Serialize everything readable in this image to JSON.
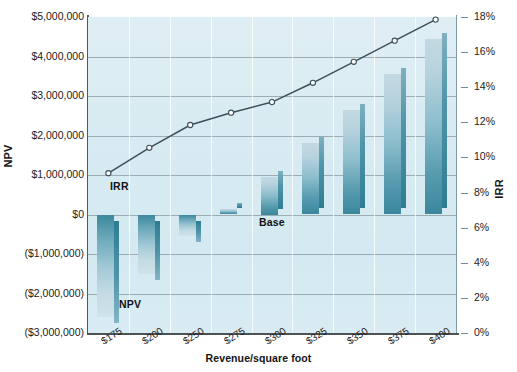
{
  "chart_data": {
    "type": "bar",
    "title": "",
    "subtitle": "",
    "xlabel": "Revenue/square foot",
    "ylabel": "NPV",
    "y2label": "IRR",
    "categories": [
      "$175",
      "$200",
      "$250",
      "$275",
      "$300",
      "$325",
      "$350",
      "$375",
      "$400"
    ],
    "series": [
      {
        "name": "NPV",
        "type": "bar",
        "axis": "left",
        "values": [
          -2600000,
          -1500000,
          -550000,
          150000,
          950000,
          1800000,
          2650000,
          3550000,
          4450000
        ]
      },
      {
        "name": "IRR",
        "type": "line",
        "axis": "right",
        "values": [
          0.091,
          0.1055,
          0.1185,
          0.1255,
          0.1315,
          0.1425,
          0.1545,
          0.1665,
          0.1785
        ]
      }
    ],
    "ylim": [
      -3000000,
      5000000
    ],
    "y2lim": [
      0,
      0.18
    ],
    "yticks": [
      "$5,000,000",
      "$4,000,000",
      "$3,000,000",
      "$2,000,000",
      "$1,000,000",
      "$0",
      "($1,000,000)",
      "($2,000,000)",
      "($3,000,000)"
    ],
    "ytick_values": [
      5000000,
      4000000,
      3000000,
      2000000,
      1000000,
      0,
      -1000000,
      -2000000,
      -3000000
    ],
    "y2ticks": [
      "18%",
      "16%",
      "14%",
      "12%",
      "10%",
      "8%",
      "6%",
      "4%",
      "2%",
      "0%"
    ],
    "y2tick_values": [
      0.18,
      0.16,
      0.14,
      0.12,
      0.1,
      0.08,
      0.06,
      0.04,
      0.02,
      0.0
    ],
    "grid": "horizontal-and-vertical",
    "legend": "inline-annotations",
    "annotations": [
      {
        "text": "IRR",
        "x_category": "$175",
        "role": "irr-line-label"
      },
      {
        "text": "NPV",
        "x_category": "$200",
        "role": "npv-bar-label"
      },
      {
        "text": "Base",
        "x_category": "$300",
        "role": "base-case-label"
      }
    ],
    "colors": {
      "plot_background": "#d7eaf2",
      "bar_top": "#c3d9e2",
      "bar_bottom": "#3b879d",
      "bar_side": "#2e7c92",
      "line": "#3d4f5a",
      "marker_fill": "#ffffff",
      "gridline": "#7e8c92",
      "axis": "#4d5256",
      "text": "#1b1b1b"
    }
  },
  "axis_titles": {
    "left": "NPV",
    "right": "IRR",
    "bottom": "Revenue/square foot"
  },
  "annotations": {
    "irr": "IRR",
    "npv": "NPV",
    "base": "Base"
  }
}
